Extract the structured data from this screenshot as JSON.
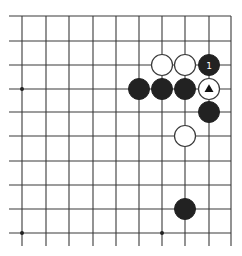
{
  "board": {
    "columns_x": [
      22,
      46,
      69,
      93,
      116,
      139,
      162,
      185,
      209,
      231
    ],
    "rows_y": [
      16,
      41,
      65,
      89,
      112,
      136,
      161,
      185,
      209,
      233
    ],
    "edges": {
      "top": true,
      "right": true,
      "left": false,
      "bottom": false
    },
    "line_color": "#3a3a3a",
    "stone_radius": 10.5,
    "star_points": [
      {
        "col": 0,
        "row": 3
      },
      {
        "col": 0,
        "row": 9
      },
      {
        "col": 6,
        "row": 9
      }
    ],
    "stones": [
      {
        "color": "white",
        "col": 6,
        "row": 2
      },
      {
        "color": "white",
        "col": 7,
        "row": 2
      },
      {
        "color": "black",
        "col": 8,
        "row": 2,
        "label": "1"
      },
      {
        "color": "black",
        "col": 5,
        "row": 3
      },
      {
        "color": "black",
        "col": 6,
        "row": 3
      },
      {
        "color": "black",
        "col": 7,
        "row": 3
      },
      {
        "color": "white",
        "col": 8,
        "row": 3,
        "mark": "triangle"
      },
      {
        "color": "black",
        "col": 8,
        "row": 4
      },
      {
        "color": "white",
        "col": 7,
        "row": 5
      },
      {
        "color": "black",
        "col": 7,
        "row": 8
      }
    ]
  }
}
